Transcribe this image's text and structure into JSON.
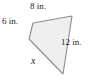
{
  "figure": {
    "type": "quadrilateral-with-side-labels",
    "fill_color": "#efefef",
    "stroke_color": "#8c8c8c",
    "text_color": "#231f20",
    "background_color": "#ffffff",
    "vertices": [
      {
        "name": "upper-left",
        "x": 33,
        "y": 23
      },
      {
        "name": "top-right",
        "x": 72,
        "y": 16
      },
      {
        "name": "bottom",
        "x": 63,
        "y": 74
      },
      {
        "name": "left",
        "x": 29,
        "y": 39
      }
    ],
    "polygon_points": "33,23 72,16 63,74 29,39",
    "labels": {
      "top": "8 in.",
      "left": "6 in.",
      "right": "12 in.",
      "bottom": "x"
    }
  }
}
